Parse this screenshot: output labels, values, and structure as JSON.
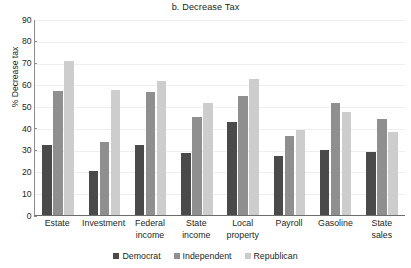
{
  "chart_data": {
    "type": "bar",
    "title": "b. Decrease Tax",
    "xlabel": "",
    "ylabel": "% Decrease tax",
    "ylim": [
      0,
      90
    ],
    "ytick_step": 10,
    "yticks": [
      90,
      80,
      70,
      60,
      50,
      40,
      30,
      20,
      10,
      0
    ],
    "grid": true,
    "legend_position": "bottom-center",
    "categories": [
      "Estate",
      "Investment",
      "Federal income",
      "State income",
      "Local property",
      "Payroll",
      "Gasoline",
      "State sales"
    ],
    "category_lines": [
      [
        "Estate",
        ""
      ],
      [
        "Investment",
        ""
      ],
      [
        "Federal",
        "income"
      ],
      [
        "State",
        "income"
      ],
      [
        "Local",
        "property"
      ],
      [
        "Payroll",
        ""
      ],
      [
        "Gasoline",
        ""
      ],
      [
        "State",
        "sales"
      ]
    ],
    "series": [
      {
        "name": "Democrat",
        "color": "#4a4a4a",
        "values": [
          32,
          20,
          32,
          28.5,
          42.5,
          27,
          30,
          29
        ]
      },
      {
        "name": "Independent",
        "color": "#8f8f8f",
        "values": [
          57,
          33.5,
          56.5,
          45,
          54.5,
          36.5,
          51.5,
          44
        ]
      },
      {
        "name": "Republican",
        "color": "#cdcdcd",
        "values": [
          70.5,
          57.5,
          61.5,
          51.5,
          62.5,
          39,
          47.5,
          38
        ]
      }
    ]
  },
  "legend": {
    "items": [
      {
        "label": "Democrat",
        "color": "#4a4a4a"
      },
      {
        "label": "Independent",
        "color": "#8f8f8f"
      },
      {
        "label": "Republican",
        "color": "#cdcdcd"
      }
    ]
  }
}
